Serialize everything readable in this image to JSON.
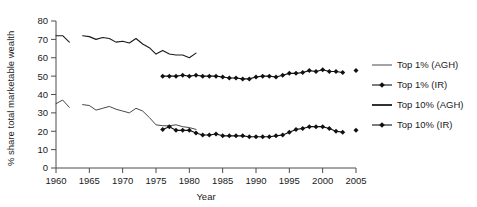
{
  "chart_data": {
    "type": "line",
    "title": "",
    "xlabel": "Year",
    "ylabel": "% share total marketable wealth",
    "xlim": [
      1960,
      2005
    ],
    "ylim": [
      0,
      80
    ],
    "xticks": [
      1960,
      1965,
      1970,
      1975,
      1980,
      1985,
      1990,
      1995,
      2000,
      2005
    ],
    "yticks": [
      0,
      10,
      20,
      30,
      40,
      50,
      60,
      70,
      80
    ],
    "grid": false,
    "legend_position": "right",
    "series": [
      {
        "name": "Top 1% (AGH)",
        "style": "line",
        "marker": "none",
        "color": "#333333",
        "segments": [
          {
            "x": [
              1960,
              1961,
              1962
            ],
            "y": [
              35.0,
              37.0,
              33.0
            ]
          },
          {
            "x": [
              1964,
              1965,
              1966,
              1967,
              1968,
              1969,
              1970,
              1971,
              1972,
              1973,
              1974,
              1975,
              1976,
              1977,
              1978,
              1979,
              1980,
              1981
            ],
            "y": [
              34.5,
              34.0,
              31.5,
              32.5,
              33.5,
              32.0,
              31.0,
              30.0,
              32.5,
              31.0,
              27.5,
              23.5,
              23.0,
              23.0,
              23.5,
              22.5,
              22.0,
              21.0
            ]
          }
        ]
      },
      {
        "name": "Top 1% (IR)",
        "style": "line-marker",
        "marker": "diamond",
        "color": "#111111",
        "segments": [
          {
            "x": [
              1976,
              1977,
              1978,
              1979,
              1980,
              1981,
              1982,
              1983,
              1984,
              1985,
              1986,
              1987,
              1988,
              1989,
              1990,
              1991,
              1992,
              1993,
              1994,
              1995,
              1996,
              1997,
              1998,
              1999,
              2000,
              2001,
              2002,
              2003
            ],
            "y": [
              21.0,
              22.5,
              20.5,
              20.5,
              20.5,
              19.0,
              18.0,
              18.0,
              18.5,
              17.5,
              17.5,
              17.5,
              17.5,
              17.0,
              17.0,
              17.0,
              17.0,
              17.5,
              18.0,
              19.5,
              21.0,
              21.5,
              22.5,
              22.5,
              22.5,
              21.5,
              20.0,
              19.5
            ]
          },
          {
            "x": [
              2005
            ],
            "y": [
              20.5
            ]
          }
        ]
      },
      {
        "name": "Top 10% (AGH)",
        "style": "line",
        "marker": "none",
        "color": "#1a1a1a",
        "segments": [
          {
            "x": [
              1960,
              1961,
              1962
            ],
            "y": [
              72.0,
              72.0,
              68.5
            ]
          },
          {
            "x": [
              1964,
              1965,
              1966,
              1967,
              1968,
              1969,
              1970,
              1971,
              1972,
              1973,
              1974,
              1975,
              1976,
              1977,
              1978,
              1979,
              1980,
              1981
            ],
            "y": [
              72.0,
              71.5,
              70.0,
              71.0,
              70.5,
              68.5,
              69.0,
              68.0,
              70.5,
              67.5,
              65.5,
              62.0,
              64.0,
              62.0,
              61.5,
              61.5,
              60.0,
              62.5
            ]
          }
        ]
      },
      {
        "name": "Top 10% (IR)",
        "style": "line-marker",
        "marker": "diamond",
        "color": "#111111",
        "segments": [
          {
            "x": [
              1976,
              1977,
              1978,
              1979,
              1980,
              1981,
              1982,
              1983,
              1984,
              1985,
              1986,
              1987,
              1988,
              1989,
              1990,
              1991,
              1992,
              1993,
              1994,
              1995,
              1996,
              1997,
              1998,
              1999,
              2000,
              2001,
              2002,
              2003
            ],
            "y": [
              50.0,
              50.0,
              50.0,
              50.5,
              50.0,
              50.5,
              50.0,
              50.0,
              50.0,
              49.5,
              49.0,
              49.0,
              48.5,
              48.5,
              49.5,
              50.0,
              50.0,
              49.5,
              50.5,
              51.5,
              51.5,
              52.0,
              53.0,
              52.5,
              53.5,
              52.5,
              52.5,
              52.0
            ]
          },
          {
            "x": [
              2005
            ],
            "y": [
              53.0
            ]
          }
        ]
      }
    ],
    "legend_entries": [
      {
        "label": "Top 1% (AGH)",
        "style": "thin-line"
      },
      {
        "label": "Top 1% (IR)",
        "style": "marker-line"
      },
      {
        "label": "Top 10% (AGH)",
        "style": "thick-line"
      },
      {
        "label": "Top 10% (IR)",
        "style": "marker-line"
      }
    ]
  }
}
